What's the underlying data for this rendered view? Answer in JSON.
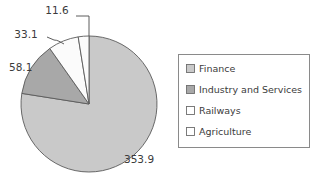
{
  "chart_data": {
    "type": "pie",
    "title": "",
    "categories": [
      "Finance",
      "Industry and Services",
      "Railways",
      "Agriculture"
    ],
    "values": [
      353.9,
      58.1,
      33.1,
      11.6
    ],
    "total": 456.7,
    "value_labels": [
      "353.9",
      "58.1",
      "33.1",
      "11.6"
    ],
    "colors": [
      "#c9c9c9",
      "#a8a8a8",
      "#fbfbfb",
      "#fbfbfb"
    ],
    "slice_edge_color": "#5a5a5a",
    "legend_position": "right",
    "grid": false,
    "xlabel": "",
    "ylabel": ""
  },
  "pie": {
    "center_x": 89,
    "center_y": 104,
    "radius": 68,
    "start_angle_deg": -90,
    "direction": "counterclockwise",
    "slices": [
      {
        "name": "agriculture-slice",
        "category": "Agriculture",
        "value": 11.6,
        "color": "#fbfbfb",
        "label": "11.6",
        "label_x": 57,
        "label_y": 14
      },
      {
        "name": "railways-slice",
        "category": "Railways",
        "value": 33.1,
        "color": "#fbfbfb",
        "label": "33.1",
        "label_x": 26,
        "label_y": 38
      },
      {
        "name": "industry-slice",
        "category": "Industry and Services",
        "value": 58.1,
        "color": "#a8a8a8",
        "label": "58.1",
        "label_x": 9,
        "label_y": 71
      },
      {
        "name": "finance-slice",
        "category": "Finance",
        "value": 353.9,
        "color": "#c9c9c9",
        "label": "353.9",
        "label_x": 124,
        "label_y": 163
      }
    ]
  },
  "legend": {
    "box": {
      "x": 178,
      "y": 54,
      "width": 132,
      "height": 94
    },
    "items": [
      {
        "label": "Finance",
        "color": "#c9c9c9"
      },
      {
        "label": "Industry and Services",
        "color": "#a8a8a8"
      },
      {
        "label": "Railways",
        "color": "#ffffff"
      },
      {
        "label": "Agriculture",
        "color": "#ffffff"
      }
    ]
  }
}
